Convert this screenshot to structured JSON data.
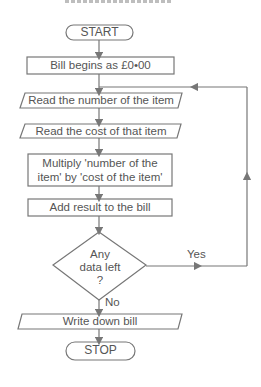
{
  "flowchart": {
    "colors": {
      "stroke": "#777777",
      "text": "#555555",
      "background": "#ffffff"
    },
    "nodes": [
      {
        "id": "start",
        "shape": "terminator",
        "text": "START"
      },
      {
        "id": "init",
        "shape": "process",
        "text": "Bill begins as £0•00"
      },
      {
        "id": "read-number",
        "shape": "input-output",
        "text": "Read the number of the item"
      },
      {
        "id": "read-cost",
        "shape": "input-output",
        "text": "Read the cost of that item"
      },
      {
        "id": "multiply",
        "shape": "process",
        "text_line1": "Multiply 'number of the",
        "text_line2": "item' by 'cost of the item'"
      },
      {
        "id": "add",
        "shape": "process",
        "text": "Add result  to the bill"
      },
      {
        "id": "decision",
        "shape": "decision",
        "text_line1": "Any",
        "text_line2": "data left",
        "text_line3": "?"
      },
      {
        "id": "write",
        "shape": "input-output",
        "text": "Write down bill"
      },
      {
        "id": "stop",
        "shape": "terminator",
        "text": "STOP"
      }
    ],
    "edges": [
      {
        "from": "start",
        "to": "init"
      },
      {
        "from": "init",
        "to": "read-number"
      },
      {
        "from": "read-number",
        "to": "read-cost"
      },
      {
        "from": "read-cost",
        "to": "multiply"
      },
      {
        "from": "multiply",
        "to": "add"
      },
      {
        "from": "add",
        "to": "decision"
      },
      {
        "from": "decision",
        "to": "read-number",
        "label": "Yes"
      },
      {
        "from": "decision",
        "to": "write",
        "label": "No"
      },
      {
        "from": "write",
        "to": "stop"
      }
    ]
  }
}
